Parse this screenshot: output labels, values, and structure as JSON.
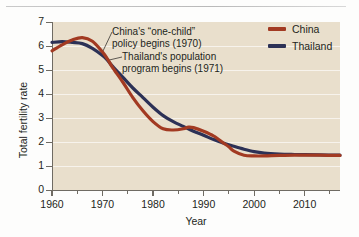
{
  "chart_data": {
    "type": "line",
    "title": "",
    "xlabel": "Year",
    "ylabel": "Total fertility rate",
    "xlim": [
      1960,
      2017
    ],
    "ylim": [
      0,
      7
    ],
    "grid": true,
    "legend_position": "top-right",
    "x_ticks": [
      1960,
      1970,
      1980,
      1990,
      2000,
      2010
    ],
    "x_minor_ticks": [
      1965,
      1975,
      1985,
      1995,
      2005,
      2015
    ],
    "y_ticks": [
      0,
      1,
      2,
      3,
      4,
      5,
      6,
      7
    ],
    "series": [
      {
        "name": "China",
        "color": "#a23a22",
        "x": [
          1960,
          1962,
          1964,
          1966,
          1968,
          1970,
          1971,
          1972,
          1974,
          1976,
          1978,
          1980,
          1982,
          1984,
          1986,
          1987,
          1988,
          1990,
          1992,
          1994,
          1995,
          1996,
          1998,
          2000,
          2002,
          2005,
          2008,
          2010,
          2013,
          2017
        ],
        "values": [
          5.8,
          6.05,
          6.25,
          6.35,
          6.2,
          5.75,
          5.45,
          5.1,
          4.5,
          3.85,
          3.3,
          2.85,
          2.55,
          2.5,
          2.55,
          2.62,
          2.6,
          2.45,
          2.25,
          1.95,
          1.8,
          1.62,
          1.45,
          1.42,
          1.42,
          1.44,
          1.45,
          1.45,
          1.45,
          1.44
        ]
      },
      {
        "name": "Thailand",
        "color": "#2c3156",
        "x": [
          1960,
          1962,
          1964,
          1966,
          1968,
          1970,
          1971,
          1972,
          1974,
          1976,
          1978,
          1980,
          1982,
          1984,
          1986,
          1988,
          1990,
          1992,
          1994,
          1996,
          1998,
          2000,
          2002,
          2005,
          2008,
          2010,
          2013,
          2017
        ],
        "values": [
          6.15,
          6.18,
          6.15,
          6.1,
          5.9,
          5.6,
          5.4,
          5.15,
          4.7,
          4.25,
          3.85,
          3.45,
          3.1,
          2.85,
          2.65,
          2.45,
          2.28,
          2.1,
          1.95,
          1.82,
          1.7,
          1.6,
          1.54,
          1.5,
          1.48,
          1.47,
          1.46,
          1.45
        ]
      }
    ],
    "annotations": [
      {
        "id": "china-policy",
        "text": "China's “one-child”\npolicy begins (1970)",
        "point_x": 1970,
        "point_y": 5.75
      },
      {
        "id": "thailand-program",
        "text": "Thailand's population\nprogram begins (1971)",
        "point_x": 1971,
        "point_y": 5.4
      }
    ]
  },
  "legend": {
    "items": [
      {
        "label": "China",
        "color": "#a23a22"
      },
      {
        "label": "Thailand",
        "color": "#2c3156"
      }
    ]
  },
  "colors": {
    "plot_background": "#e9dfcc",
    "page_background": "#fdfdfc",
    "axis": "#6f6b63",
    "text": "#231f20",
    "gridline": "#ffffff"
  }
}
